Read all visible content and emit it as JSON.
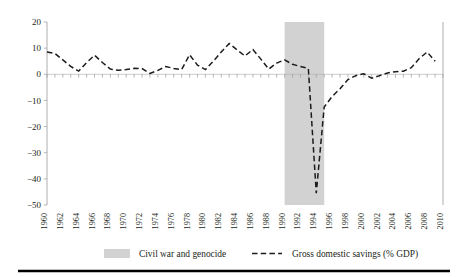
{
  "figure": {
    "background": "#ffffff",
    "series_color": "#1b1b1b",
    "band_color": "#d2d2d2",
    "axis_color": "#9a9a9a",
    "rule_color": "#000000"
  },
  "legend": {
    "position": "bottom-center",
    "items": [
      {
        "label": "Civil war and genocide",
        "marker": "filled-swatch",
        "color": "#d2d2d2"
      },
      {
        "label": "Gross domestic savings (% GDP)",
        "marker": "dashed-line",
        "color": "#1b1b1b"
      }
    ]
  },
  "chart_data": {
    "type": "line",
    "title": "",
    "subtitle": "",
    "xlabel": "",
    "ylabel": "",
    "grid": false,
    "legend_position": "bottom",
    "xlim": [
      1960,
      2010
    ],
    "ylim": [
      -50,
      20
    ],
    "ytick_labels": [
      "20",
      "10",
      "0",
      "-10",
      "-20",
      "-30",
      "-40",
      "-50"
    ],
    "yticks": [
      20,
      10,
      0,
      -10,
      -20,
      -30,
      -40,
      -50
    ],
    "xtick_labels": [
      "1960",
      "1962",
      "1964",
      "1966",
      "1968",
      "1970",
      "1972",
      "1974",
      "1976",
      "1978",
      "1980",
      "1982",
      "1984",
      "1986",
      "1988",
      "1990",
      "1992",
      "1994",
      "1996",
      "1998",
      "2000",
      "2002",
      "2004",
      "2006",
      "2008",
      "2010"
    ],
    "xticks": [
      1960,
      1962,
      1964,
      1966,
      1968,
      1970,
      1972,
      1974,
      1976,
      1978,
      1980,
      1982,
      1984,
      1986,
      1988,
      1990,
      1992,
      1994,
      1996,
      1998,
      2000,
      2002,
      2004,
      2006,
      2008,
      2010
    ],
    "x": [
      1960,
      1961,
      1962,
      1963,
      1964,
      1965,
      1966,
      1967,
      1968,
      1969,
      1970,
      1971,
      1972,
      1973,
      1974,
      1975,
      1976,
      1977,
      1978,
      1979,
      1980,
      1981,
      1982,
      1983,
      1984,
      1985,
      1986,
      1987,
      1988,
      1989,
      1990,
      1991,
      1992,
      1993,
      1994,
      1995,
      1996,
      1997,
      1998,
      1999,
      2000,
      2001,
      2002,
      2003,
      2004,
      2005,
      2006,
      2007,
      2008,
      2009
    ],
    "series": [
      {
        "name": "Gross domestic savings (% GDP)",
        "style": "dashed",
        "values": [
          8.5,
          8.0,
          5.5,
          3.0,
          1.2,
          4.5,
          7.3,
          4.5,
          2.0,
          1.5,
          1.8,
          2.3,
          2.2,
          0.3,
          1.5,
          3.0,
          2.2,
          1.8,
          7.5,
          3.5,
          1.8,
          5.0,
          8.5,
          11.8,
          9.3,
          7.0,
          9.5,
          5.8,
          2.0,
          4.3,
          5.5,
          3.8,
          3.0,
          2.2,
          -45.5,
          -12.5,
          -8.5,
          -5.5,
          -2.0,
          -0.5,
          0.2,
          -1.5,
          -0.5,
          0.5,
          1.0,
          1.2,
          2.5,
          6.0,
          8.5,
          5.0
        ]
      }
    ],
    "annotations": [
      {
        "type": "vspan",
        "label": "Civil war and genocide",
        "x_start": 1990,
        "x_end": 1995,
        "color": "#d2d2d2"
      }
    ]
  }
}
